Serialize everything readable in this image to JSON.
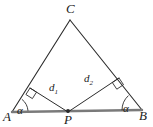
{
  "figure": {
    "kind": "geometry-diagram",
    "background_color": "#ffffff",
    "stroke_color": "#2b2b2b",
    "base_color": "#7a7a7a"
  },
  "vertices": [
    {
      "id": "C",
      "label": "C",
      "x": 70,
      "y": 20
    },
    {
      "id": "A",
      "label": "A",
      "x": 12,
      "y": 112
    },
    {
      "id": "B",
      "label": "B",
      "x": 142,
      "y": 110
    },
    {
      "id": "P",
      "label": "P",
      "x": 68,
      "y": 112
    }
  ],
  "segments": [
    {
      "id": "AC",
      "from": "A",
      "to": "C",
      "style": "thin"
    },
    {
      "id": "BC",
      "from": "B",
      "to": "C",
      "style": "thin"
    },
    {
      "id": "AB",
      "from": "A",
      "to": "B",
      "style": "thick-gray"
    },
    {
      "id": "Pd1",
      "from": "P",
      "to": "F1",
      "style": "thin"
    },
    {
      "id": "Pd2",
      "from": "P",
      "to": "F2",
      "style": "thin"
    }
  ],
  "feet": [
    {
      "id": "F1",
      "on_segment": "AC",
      "x": 30,
      "y": 88
    },
    {
      "id": "F2",
      "on_segment": "BC",
      "x": 119,
      "y": 78
    }
  ],
  "distance_labels": [
    {
      "id": "d1",
      "base": "d",
      "sub": "1",
      "from": "P",
      "to": "F1"
    },
    {
      "id": "d2",
      "base": "d",
      "sub": "2",
      "from": "P",
      "to": "F2"
    }
  ],
  "angle_labels": [
    {
      "id": "alpha-A",
      "label": "α",
      "at_vertex": "A"
    },
    {
      "id": "alpha-B",
      "label": "α",
      "at_vertex": "B"
    }
  ],
  "right_angle_marks": [
    {
      "id": "right-angle-d1",
      "at": "F1"
    },
    {
      "id": "right-angle-d2",
      "at": "F2"
    }
  ]
}
